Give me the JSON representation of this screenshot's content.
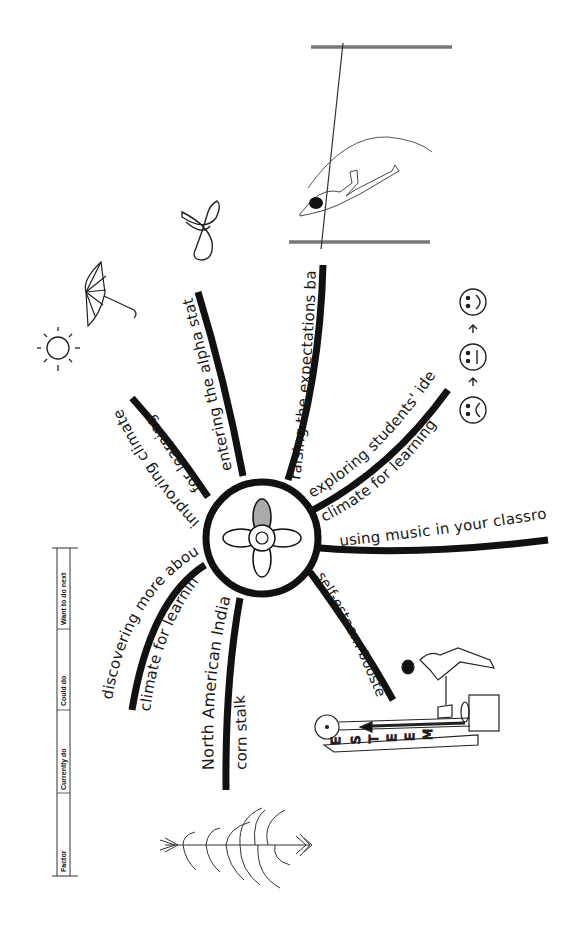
{
  "center": {
    "label": "climate for learning hub",
    "petal_fill": "#aaaaaa"
  },
  "branches": [
    {
      "id": "improving-climate",
      "line1": "improving climate",
      "line2": "for learning"
    },
    {
      "id": "alpha-state",
      "line1": "entering the alpha state"
    },
    {
      "id": "expectations-bar",
      "line1": "raising the expectations bar"
    },
    {
      "id": "students-ideal",
      "line1": "exploring students' ideal",
      "line2": "climate for learning"
    },
    {
      "id": "music",
      "line1": "using music in your classroom"
    },
    {
      "id": "self-esteem",
      "line1": "self-esteem booster"
    },
    {
      "id": "corn-stalk",
      "line1": "North American Indian",
      "line2": "corn stalk"
    },
    {
      "id": "discovering",
      "line1": "discovering more about",
      "line2": "climate for learning"
    }
  ],
  "table": {
    "columns": [
      "Factor",
      "Currently do",
      "Could do",
      "Want to do next"
    ]
  },
  "illustrations": {
    "alpha_symbol": "α",
    "esteem_letters": [
      "E",
      "S",
      "T",
      "E",
      "E",
      "M"
    ],
    "faces": [
      "sad",
      "neutral",
      "happy"
    ],
    "arrow": "→"
  }
}
